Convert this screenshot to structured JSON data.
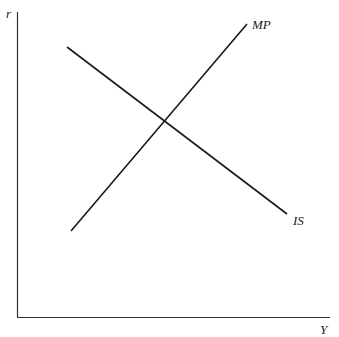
{
  "diagram": {
    "axes": {
      "y_label": "r",
      "x_label": "Y"
    },
    "curves": [
      {
        "name": "IS",
        "label": "IS",
        "slope": "downward"
      },
      {
        "name": "MP",
        "label": "MP",
        "slope": "upward"
      }
    ],
    "colors": {
      "line": "#1a1a1a",
      "axis": "#333333",
      "background": "#ffffff"
    }
  }
}
